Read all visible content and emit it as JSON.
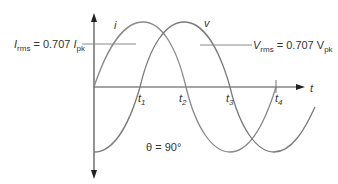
{
  "diagram": {
    "curves": [
      {
        "name": "current",
        "label": "i",
        "color": "#8a8a8a",
        "phase_deg": 90
      },
      {
        "name": "voltage",
        "label": "v",
        "color": "#7a7a7a",
        "phase_deg": 0
      }
    ],
    "axis": {
      "x_label": "t"
    },
    "time_marks": [
      {
        "label": "t",
        "sub": "1"
      },
      {
        "label": "t",
        "sub": "2"
      },
      {
        "label": "t",
        "sub": "3"
      },
      {
        "label": "t",
        "sub": "4"
      }
    ],
    "rms_current": {
      "main": "I",
      "main_sub": "rms",
      "eq": " = 0.707 ",
      "pk": "I",
      "pk_sub": "pk"
    },
    "rms_voltage": {
      "main": "V",
      "main_sub": "rms",
      "eq": " = 0.707 V",
      "pk_sub": "pk"
    },
    "phase_label": "θ = 90°"
  }
}
